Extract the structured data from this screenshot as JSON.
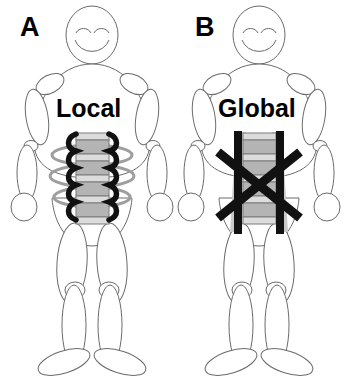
{
  "figure": {
    "background_color": "#ffffff",
    "width": 349,
    "height": 386
  },
  "panels": [
    {
      "id": "panel-a",
      "letter": "A",
      "label": "Local",
      "icon_name": "stick-figure-local-stabilizers",
      "description": "Stick figure with lumbar spine shown with deep segmental (local) muscles drawn as thick black wavy lines alongside each vertebra and grey horizontal rings encircling the spine",
      "spine": {
        "vertebra_count": 5,
        "vertebra_color": "#b0b0b0",
        "disc_color": "#e0e0e0",
        "outline_color": "#7a7a7a"
      },
      "local_muscles": {
        "stroke_color": "#111111",
        "stroke_width": 5,
        "shape": "wavy-segmental",
        "sides": 2
      },
      "rings": {
        "count": 3,
        "color": "#9a9a9a",
        "shape": "ellipse"
      }
    },
    {
      "id": "panel-b",
      "letter": "B",
      "label": "Global",
      "icon_name": "stick-figure-global-stabilizers",
      "description": "Stick figure with lumbar spine shown with large superficial (global) muscles drawn as two thick vertical black bars and two thick crossing diagonal black bars forming an X over the trunk",
      "spine": {
        "vertebra_count": 5,
        "vertebra_color": "#b0b0b0",
        "disc_color": "#e0e0e0",
        "outline_color": "#7a7a7a"
      },
      "global_muscles": {
        "stroke_color": "#111111",
        "vertical_bar_count": 2,
        "vertical_bar_width": 8,
        "diagonal_bar_count": 2,
        "diagonal_bar_width": 9,
        "shape": "crossed-x-with-verticals"
      },
      "grey_bands": {
        "color": "#c8c8c8",
        "count": 2
      }
    }
  ],
  "body_parts": {
    "outline_color": "#666666",
    "outline_width": 1,
    "fill_color": "#ffffff",
    "parts": [
      "head",
      "eye-left",
      "eye-right",
      "mouth",
      "torso",
      "shoulder-left",
      "shoulder-right",
      "upper-arm-left",
      "upper-arm-right",
      "elbow-left",
      "elbow-right",
      "forearm-left",
      "forearm-right",
      "hand-left",
      "hand-right",
      "pelvis",
      "thigh-left",
      "thigh-right",
      "knee-left",
      "knee-right",
      "shin-left",
      "shin-right",
      "foot-left",
      "foot-right"
    ]
  }
}
